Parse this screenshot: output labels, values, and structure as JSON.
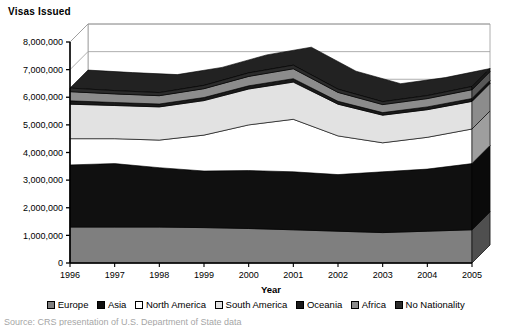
{
  "chart_title": "Visas Issued",
  "source_note": "Source: CRS presentation of U.S. Department of State data",
  "axes": {
    "x_title": "Year",
    "y_ticks": [
      "0",
      "1,000,000",
      "2,000,000",
      "3,000,000",
      "4,000,000",
      "5,000,000",
      "6,000,000",
      "7,000,000",
      "8,000,000"
    ],
    "x_ticks": [
      "1996",
      "1997",
      "1998",
      "1999",
      "2000",
      "2001",
      "2002",
      "2003",
      "2004",
      "2005"
    ]
  },
  "legend": {
    "position": "bottom",
    "items": [
      {
        "label": "Europe",
        "color": "#7f7f7f"
      },
      {
        "label": "Asia",
        "color": "#101010"
      },
      {
        "label": "North America",
        "color": "#ffffff"
      },
      {
        "label": "South America",
        "color": "#e2e2e2"
      },
      {
        "label": "Oceania",
        "color": "#1a1a1a"
      },
      {
        "label": "Africa",
        "color": "#8c8c8c"
      },
      {
        "label": "No Nationality",
        "color": "#2b2b2b"
      }
    ]
  },
  "chart_data": {
    "type": "area",
    "stacked": true,
    "three_d": true,
    "title": "Visas Issued",
    "xlabel": "Year",
    "ylabel": "",
    "categories": [
      "1996",
      "1997",
      "1998",
      "1999",
      "2000",
      "2001",
      "2002",
      "2003",
      "2004",
      "2005"
    ],
    "ylim": [
      0,
      8000000
    ],
    "ytick_step": 1000000,
    "grid": true,
    "series": [
      {
        "name": "Europe",
        "color": "#7f7f7f",
        "values": [
          1300000,
          1300000,
          1300000,
          1280000,
          1250000,
          1200000,
          1150000,
          1100000,
          1150000,
          1200000
        ]
      },
      {
        "name": "Asia",
        "color": "#101010",
        "values": [
          2250000,
          2300000,
          2150000,
          2050000,
          2100000,
          2100000,
          2050000,
          2200000,
          2250000,
          2400000
        ]
      },
      {
        "name": "North America",
        "color": "#ffffff",
        "values": [
          950000,
          900000,
          1000000,
          1300000,
          1650000,
          1900000,
          1400000,
          1050000,
          1150000,
          1250000
        ]
      },
      {
        "name": "South America",
        "color": "#e2e2e2",
        "values": [
          1250000,
          1200000,
          1200000,
          1250000,
          1300000,
          1350000,
          1150000,
          1000000,
          1000000,
          1000000
        ]
      },
      {
        "name": "Oceania",
        "color": "#1a1a1a",
        "values": [
          120000,
          110000,
          105000,
          110000,
          115000,
          120000,
          105000,
          95000,
          100000,
          105000
        ]
      },
      {
        "name": "Africa",
        "color": "#8c8c8c",
        "values": [
          330000,
          310000,
          300000,
          320000,
          340000,
          360000,
          320000,
          290000,
          300000,
          320000
        ]
      },
      {
        "name": "No Nationality",
        "color": "#2b2b2b",
        "values": [
          130000,
          120000,
          115000,
          120000,
          125000,
          130000,
          115000,
          105000,
          110000,
          115000
        ]
      }
    ],
    "totals": [
      6330000,
      6240000,
      6170000,
      6430000,
      6880000,
      7160000,
      6290000,
      5840000,
      6060000,
      6390000
    ]
  }
}
